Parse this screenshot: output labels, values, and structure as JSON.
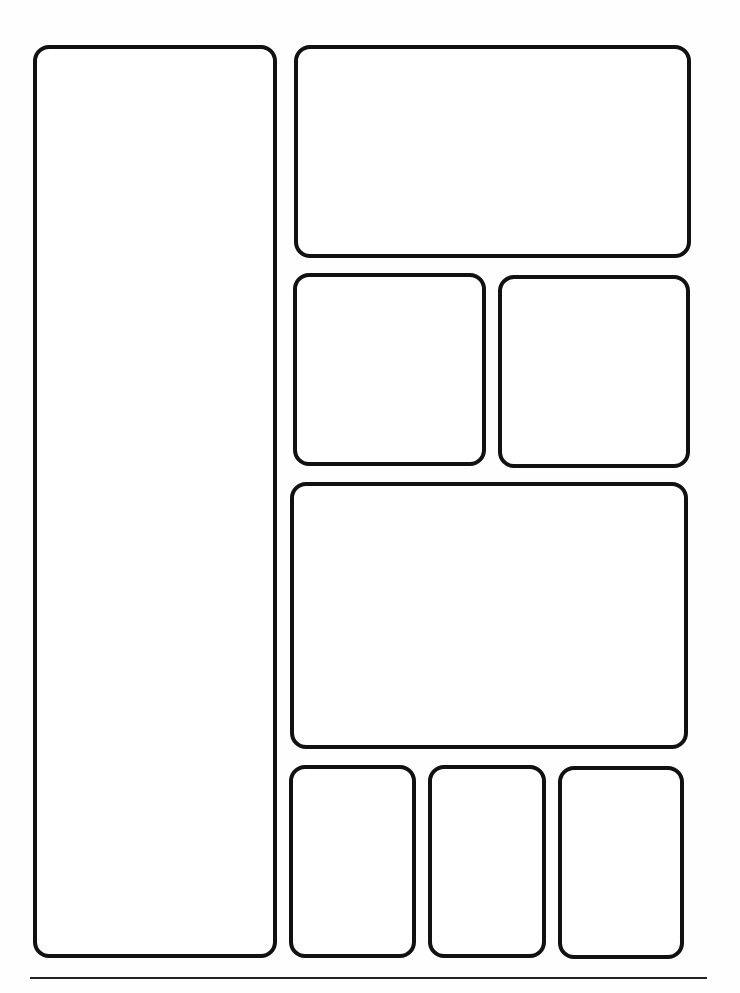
{
  "page": {
    "type": "comic-panel-template",
    "background": "#fefefe",
    "border_color": "#111111",
    "panel_count": 8
  },
  "panels": [
    {
      "id": 1,
      "x": 33,
      "y": 45,
      "w": 244,
      "h": 913
    },
    {
      "id": 2,
      "x": 294,
      "y": 45,
      "w": 397,
      "h": 213
    },
    {
      "id": 3,
      "x": 293,
      "y": 273,
      "w": 193,
      "h": 193
    },
    {
      "id": 4,
      "x": 498,
      "y": 275,
      "w": 192,
      "h": 193
    },
    {
      "id": 5,
      "x": 290,
      "y": 482,
      "w": 398,
      "h": 267
    },
    {
      "id": 6,
      "x": 289,
      "y": 765,
      "w": 127,
      "h": 193
    },
    {
      "id": 7,
      "x": 428,
      "y": 765,
      "w": 118,
      "h": 193
    },
    {
      "id": 8,
      "x": 558,
      "y": 766,
      "w": 126,
      "h": 193
    }
  ],
  "bottom_rule": {
    "x": 30,
    "y": 977,
    "w": 677
  }
}
